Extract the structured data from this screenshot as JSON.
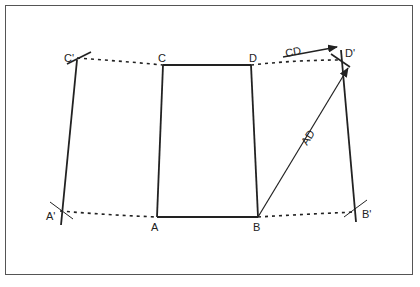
{
  "diagram": {
    "title": "",
    "points": {
      "A": {
        "label": "A",
        "x": 157,
        "y": 217
      },
      "B": {
        "label": "B",
        "x": 258,
        "y": 217
      },
      "C": {
        "label": "C",
        "x": 163,
        "y": 65
      },
      "D": {
        "label": "D",
        "x": 251,
        "y": 65
      },
      "A_prime": {
        "label": "A'",
        "x": 60,
        "y": 211
      },
      "B_prime": {
        "label": "B'",
        "x": 356,
        "y": 212
      },
      "C_prime": {
        "label": "C'",
        "x": 77,
        "y": 58
      },
      "D_prime": {
        "label": "D'",
        "x": 340,
        "y": 60
      }
    },
    "vectors": {
      "CD": {
        "label": "CD"
      },
      "AD": {
        "label": "AD"
      }
    },
    "colors": {
      "line": "#222222",
      "frame": "#555555",
      "background": "#ffffff"
    }
  }
}
